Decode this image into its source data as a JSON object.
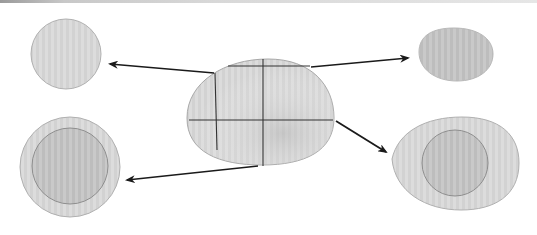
{
  "diagram": {
    "colors": {
      "cell_fill": "#d9d9d9",
      "cell_fill_dark": "#c2c2c2",
      "outline": "#a8a8a8",
      "cleavage_line": "#333333",
      "arrow": "#1a1a1a"
    },
    "central_egg": {
      "label": "",
      "divisions": "4 cells (one vertical pair of planes, one horizontal plane)"
    },
    "products": [
      {
        "id": "top-left",
        "shape": "small round cell, no nucleus",
        "label": ""
      },
      {
        "id": "top-right",
        "shape": "small oval cell, no nucleus",
        "label": ""
      },
      {
        "id": "bottom-left",
        "shape": "round cell with large inner nucleus",
        "label": ""
      },
      {
        "id": "bottom-right",
        "shape": "egg-shaped cell with inner nucleus",
        "label": ""
      }
    ],
    "arrows": [
      {
        "from": "central-egg",
        "to": "top-left"
      },
      {
        "from": "central-egg",
        "to": "top-right"
      },
      {
        "from": "central-egg",
        "to": "bottom-left"
      },
      {
        "from": "central-egg",
        "to": "bottom-right"
      }
    ]
  }
}
